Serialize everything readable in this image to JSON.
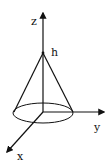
{
  "diagram": {
    "type": "3d-axes-cone",
    "labels": {
      "z_axis": "z",
      "y_axis": "y",
      "x_axis": "x",
      "apex": "h"
    },
    "colors": {
      "stroke": "#111111",
      "background": "#ffffff"
    }
  }
}
